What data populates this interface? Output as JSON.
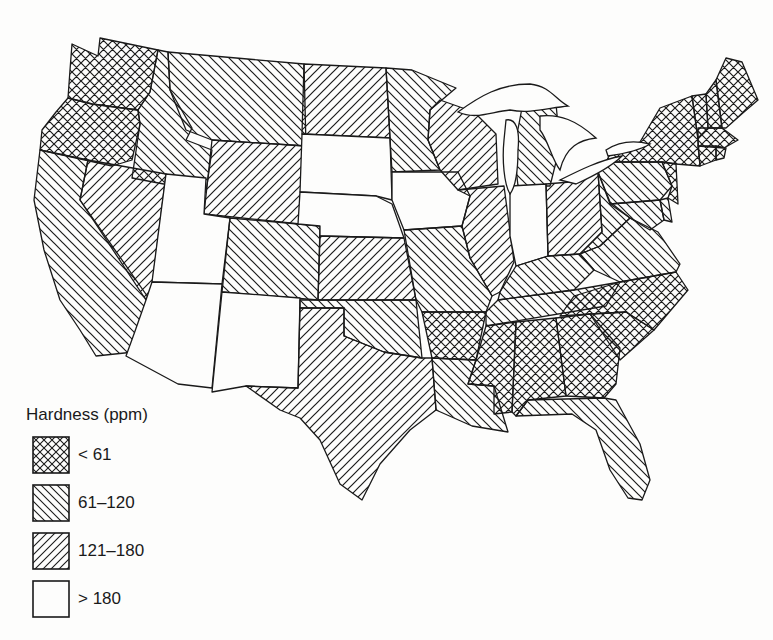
{
  "map": {
    "subject": "Water hardness of public supplies by state, contiguous United States",
    "categories": [
      {
        "id": "lt61",
        "label": "< 61",
        "pattern": "crosshatch"
      },
      {
        "id": "r61_120",
        "label": "61–120",
        "pattern": "backslash-hatch"
      },
      {
        "id": "r121_180",
        "label": "121–180",
        "pattern": "slash-hatch"
      },
      {
        "id": "gt180",
        "label": "> 180",
        "pattern": "blank"
      }
    ],
    "states": {
      "WA": "lt61",
      "OR": "lt61",
      "CA": "r61_120",
      "ID": "r61_120",
      "NV": "r121_180",
      "MT": "r61_120",
      "WY": "r121_180",
      "UT": "gt180",
      "AZ": "gt180",
      "CO": "r61_120",
      "NM": "gt180",
      "ND": "r121_180",
      "SD": "gt180",
      "NE": "gt180",
      "KS": "r121_180",
      "OK": "r61_120",
      "TX": "r121_180",
      "MN": "r61_120",
      "IA": "gt180",
      "MO": "r61_120",
      "AR": "lt61",
      "LA": "r61_120",
      "WI": "r121_180",
      "IL": "r121_180",
      "MI": "r61_120",
      "IN": "gt180",
      "OH": "r121_180",
      "KY": "r61_120",
      "TN": "r61_120",
      "MS": "lt61",
      "AL": "lt61",
      "GA": "lt61",
      "FL": "r61_120",
      "SC": "lt61",
      "NC": "lt61",
      "VA": "r61_120",
      "WV": "r61_120",
      "PA": "r61_120",
      "MD": "r61_120",
      "DE": "r61_120",
      "NJ": "lt61",
      "NY": "lt61",
      "CT": "lt61",
      "RI": "lt61",
      "MA": "lt61",
      "VT": "lt61",
      "NH": "lt61",
      "ME": "lt61"
    }
  },
  "legend": {
    "title": "Hardness (ppm)",
    "items": [
      {
        "label": "< 61"
      },
      {
        "label": "61–120"
      },
      {
        "label": "121–180"
      },
      {
        "label": "> 180"
      }
    ]
  }
}
